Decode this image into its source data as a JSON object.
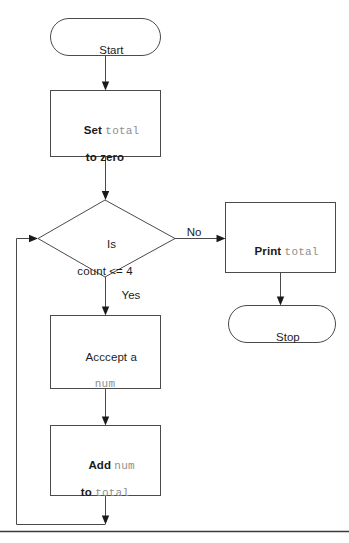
{
  "diagram": {
    "background_color": "#ffffff",
    "stroke_color": "#4a4a4a",
    "keyword_color": "#1a1a1a",
    "code_color": "#8e8e8e"
  },
  "nodes": {
    "start": {
      "label": "Start",
      "shape": "terminal"
    },
    "set_total": {
      "line1_keyword": "Set",
      "line1_code": "total",
      "line2_keyword": "to zero",
      "shape": "process"
    },
    "decision": {
      "line1": "Is",
      "line2": "count <= 4",
      "shape": "decision"
    },
    "print_total": {
      "keyword": "Print",
      "code": "total",
      "shape": "process"
    },
    "stop": {
      "label": "Stop",
      "shape": "terminal"
    },
    "accept_num": {
      "line1": "Acccept a",
      "line2_code": "num",
      "shape": "process"
    },
    "add_num": {
      "line1_keyword": "Add",
      "line1_code": "num",
      "line2_keyword": "to",
      "line2_code": "total",
      "shape": "process"
    }
  },
  "edges": {
    "no_label": "No",
    "yes_label": "Yes"
  }
}
